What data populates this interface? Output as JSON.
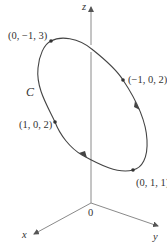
{
  "figure": {
    "type": "3D space curve diagram",
    "curve_label": "C",
    "axes": {
      "z": "z",
      "x": "x",
      "y": "y",
      "origin": "0"
    },
    "points": [
      {
        "label": "(0, −1, 3)"
      },
      {
        "label": "(−1, 0, 2)"
      },
      {
        "label": "(1, 0, 2)"
      },
      {
        "label": "(0, 1, 1)"
      }
    ],
    "colors": {
      "axis": "#888888",
      "curve": "#444444",
      "text": "#333333"
    }
  }
}
